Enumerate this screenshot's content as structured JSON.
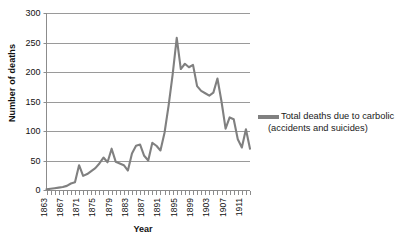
{
  "chart_data": {
    "type": "line",
    "title": "Deaths due to carbolic acid",
    "xlabel": "Year",
    "ylabel": "Number of deaths",
    "ylim": [
      0,
      300
    ],
    "ytick_labels": [
      "300",
      "250",
      "200",
      "150",
      "100",
      "50",
      "0"
    ],
    "ytick_values": [
      300,
      250,
      200,
      150,
      100,
      50,
      0
    ],
    "xlim": [
      1863,
      1913
    ],
    "xtick_labels": [
      "1863",
      "1867",
      "1871",
      "1875",
      "1879",
      "1883",
      "1887",
      "1891",
      "1895",
      "1899",
      "1903",
      "1907",
      "1911"
    ],
    "xtick_values": [
      1863,
      1867,
      1871,
      1875,
      1879,
      1883,
      1887,
      1891,
      1895,
      1899,
      1903,
      1907,
      1911
    ],
    "grid": true,
    "grid_axis": "y",
    "legend_position": "right",
    "legend": [
      "Total deaths due to carbolic (accidents and suicides)"
    ],
    "series": [
      {
        "name": "Total deaths due to carbolic (accidents and suicides)",
        "color": "#808080",
        "x": [
          1863,
          1864,
          1865,
          1866,
          1867,
          1868,
          1869,
          1870,
          1871,
          1872,
          1873,
          1874,
          1875,
          1876,
          1877,
          1878,
          1879,
          1880,
          1881,
          1882,
          1883,
          1884,
          1885,
          1886,
          1887,
          1888,
          1889,
          1890,
          1891,
          1892,
          1893,
          1894,
          1895,
          1896,
          1897,
          1898,
          1899,
          1900,
          1901,
          1902,
          1903,
          1904,
          1905,
          1906,
          1907,
          1908,
          1909,
          1910,
          1911,
          1912,
          1913
        ],
        "values": [
          1,
          2,
          3,
          4,
          5,
          7,
          11,
          13,
          42,
          24,
          27,
          32,
          37,
          45,
          55,
          47,
          70,
          48,
          45,
          42,
          33,
          62,
          75,
          77,
          58,
          50,
          80,
          75,
          67,
          97,
          143,
          196,
          258,
          205,
          214,
          208,
          212,
          176,
          168,
          164,
          160,
          165,
          189,
          150,
          104,
          123,
          120,
          86,
          72,
          103,
          70
        ]
      }
    ]
  }
}
